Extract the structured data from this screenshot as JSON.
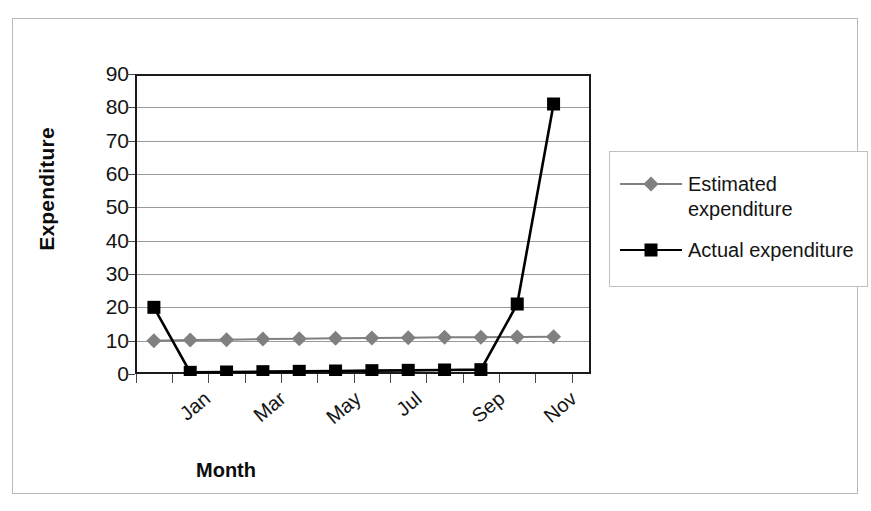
{
  "chart_data": {
    "type": "line",
    "title": "",
    "xlabel": "Month",
    "ylabel": "Expenditure",
    "ylim": [
      0,
      90
    ],
    "ytick_step": 10,
    "yticks": [
      0,
      10,
      20,
      30,
      40,
      50,
      60,
      70,
      80,
      90
    ],
    "grid": true,
    "legend_position": "right",
    "categories": [
      "Jan",
      "Feb",
      "Mar",
      "Apr",
      "May",
      "Jun",
      "Jul",
      "Aug",
      "Sep",
      "Oct",
      "Nov",
      "Dec"
    ],
    "xtick_labels_shown": [
      "Jan",
      "Mar",
      "May",
      "Jul",
      "Sep",
      "Nov"
    ],
    "series": [
      {
        "name": "Estimated expenditure",
        "marker": "diamond",
        "color": "#808080",
        "values": [
          10,
          10.2,
          10.3,
          10.5,
          10.6,
          10.7,
          10.8,
          10.9,
          11,
          11,
          11.1,
          11.2
        ]
      },
      {
        "name": "Actual expenditure",
        "marker": "square",
        "color": "#000000",
        "values": [
          20,
          0.5,
          0.6,
          0.7,
          0.8,
          0.9,
          1,
          1.1,
          1.2,
          1.3,
          21,
          81
        ]
      }
    ]
  },
  "axes": {
    "y_title": "Expenditure",
    "x_title": "Month"
  },
  "legend": {
    "items": [
      {
        "label_line1": "Estimated",
        "label_line2": "expenditure",
        "label": "Estimated expenditure",
        "color": "#808080",
        "marker": "diamond"
      },
      {
        "label_line1": "Actual expenditure",
        "label_line2": "",
        "label": "Actual expenditure",
        "color": "#000000",
        "marker": "square"
      }
    ]
  },
  "colors": {
    "estimated": "#808080",
    "actual": "#000000",
    "axis": "#1a1a1a",
    "gridline": "#9a9a9a",
    "frame": "#b9b9b9",
    "legend_border": "#c0c0c0",
    "background": "#ffffff"
  }
}
